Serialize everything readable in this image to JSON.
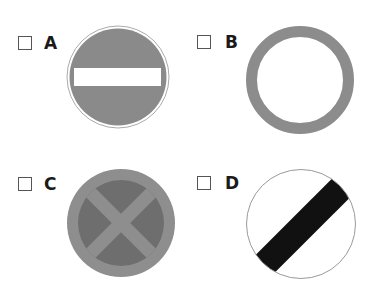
{
  "options": [
    {
      "id": "A",
      "label": "A",
      "sign": "no-entry",
      "checked": false
    },
    {
      "id": "B",
      "label": "B",
      "sign": "no-vehicles",
      "checked": false
    },
    {
      "id": "C",
      "label": "C",
      "sign": "no-stopping-clearway",
      "checked": false
    },
    {
      "id": "D",
      "label": "D",
      "sign": "national-speed-limit",
      "checked": false
    }
  ],
  "colors": {
    "sign_gray": "#8a8a8a",
    "sign_dark_gray": "#6e6e6e",
    "ring_gray": "#8c8c8c",
    "band_black": "#111111",
    "outline": "#9a9a9a"
  }
}
